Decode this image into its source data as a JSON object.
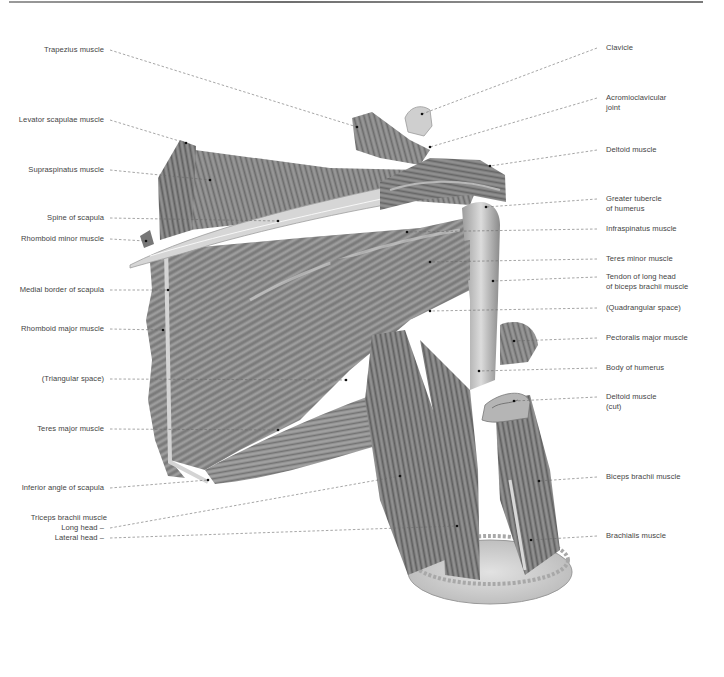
{
  "figure": {
    "labels_left": [
      {
        "id": "trapezius",
        "text": "Trapezius muscle",
        "y": 50,
        "x1": 110,
        "x2": 357,
        "y2": 127
      },
      {
        "id": "levator-scapulae",
        "text": "Levator scapulae muscle",
        "y": 120,
        "x1": 110,
        "x2": 186,
        "y2": 143
      },
      {
        "id": "supraspinatus",
        "text": "Supraspinatus muscle",
        "y": 170,
        "x1": 110,
        "x2": 210,
        "y2": 180
      },
      {
        "id": "spine-of-scapula",
        "text": "Spine of scapula",
        "y": 218,
        "x1": 110,
        "x2": 278,
        "y2": 221
      },
      {
        "id": "rhomboid-minor",
        "text": "Rhomboid minor muscle",
        "y": 239,
        "x1": 110,
        "x2": 146,
        "y2": 241
      },
      {
        "id": "medial-border",
        "text": "Medial border of scapula",
        "y": 290,
        "x1": 110,
        "x2": 168,
        "y2": 290
      },
      {
        "id": "rhomboid-major",
        "text": "Rhomboid major muscle",
        "y": 329,
        "x1": 110,
        "x2": 163,
        "y2": 330
      },
      {
        "id": "triangular-space",
        "text": "(Triangular space)",
        "y": 379,
        "x1": 110,
        "x2": 346,
        "y2": 380
      },
      {
        "id": "teres-major",
        "text": "Teres major muscle",
        "y": 429,
        "x1": 110,
        "x2": 278,
        "y2": 430
      },
      {
        "id": "inferior-angle",
        "text": "Inferior angle of scapula",
        "y": 488,
        "x1": 110,
        "x2": 208,
        "y2": 480
      },
      {
        "id": "triceps-long-head",
        "text": "Long head –",
        "y": 528,
        "x1": 110,
        "x2": 400,
        "y2": 476
      },
      {
        "id": "triceps-lateral-head",
        "text": "Lateral head –",
        "y": 538,
        "x1": 110,
        "x2": 457,
        "y2": 526
      }
    ],
    "triceps_group_label": "Triceps brachii muscle",
    "labels_right": [
      {
        "id": "clavicle",
        "text": "Clavicle",
        "line2": "",
        "y": 48,
        "x1": 597,
        "x2": 422,
        "y2": 114
      },
      {
        "id": "acromioclavicular-joint",
        "text": "Acromioclavicular",
        "line2": "joint",
        "y": 98,
        "x1": 597,
        "x2": 430,
        "y2": 147
      },
      {
        "id": "deltoid",
        "text": "Deltoid muscle",
        "line2": "",
        "y": 150,
        "x1": 597,
        "x2": 490,
        "y2": 166
      },
      {
        "id": "greater-tubercle",
        "text": "Greater tubercle",
        "line2": "of humerus",
        "y": 199,
        "x1": 597,
        "x2": 486,
        "y2": 207
      },
      {
        "id": "infraspinatus",
        "text": "Infraspinatus muscle",
        "y": 229,
        "line2": "",
        "x1": 597,
        "x2": 407,
        "y2": 232
      },
      {
        "id": "teres-minor",
        "text": "Teres minor muscle",
        "y": 259,
        "line2": "",
        "x1": 597,
        "x2": 430,
        "y2": 262
      },
      {
        "id": "biceps-long-head-tendon",
        "text": "Tendon of long head",
        "line2": "of biceps brachii muscle",
        "y": 277,
        "x1": 597,
        "x2": 493,
        "y2": 281
      },
      {
        "id": "quadrangular-space",
        "text": "(Quadrangular space)",
        "line2": "",
        "y": 308,
        "x1": 597,
        "x2": 430,
        "y2": 311
      },
      {
        "id": "pectoralis-major",
        "text": "Pectoralis major muscle",
        "line2": "",
        "y": 338,
        "x1": 597,
        "x2": 514,
        "y2": 341
      },
      {
        "id": "body-of-humerus",
        "text": "Body of humerus",
        "line2": "",
        "y": 368,
        "x1": 597,
        "x2": 479,
        "y2": 371
      },
      {
        "id": "deltoid-cut",
        "text": "Deltoid muscle",
        "line2": "(cut)",
        "y": 397,
        "x1": 597,
        "x2": 514,
        "y2": 401
      },
      {
        "id": "biceps-brachii",
        "text": "Biceps brachii muscle",
        "line2": "",
        "y": 477,
        "x1": 597,
        "x2": 539,
        "y2": 481
      },
      {
        "id": "brachialis",
        "text": "Brachialis muscle",
        "line2": "",
        "y": 536,
        "x1": 597,
        "x2": 531,
        "y2": 540
      }
    ]
  },
  "colors": {
    "label_text": "#444444",
    "leader_line": "#6a6a6a",
    "rule": "#7a7a7a",
    "muscle_dark": "#5a5a5a",
    "muscle_mid": "#8c8c8c",
    "muscle_light": "#c4c4c4",
    "bone": "#d8d8d8"
  }
}
